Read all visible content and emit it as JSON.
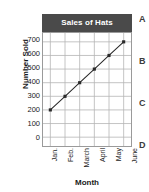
{
  "chart_data": {
    "type": "line",
    "title": "Sales of Hats",
    "xlabel": "Month",
    "ylabel": "Number Sold",
    "categories": [
      "Jan.",
      "Feb.",
      "March",
      "April",
      "May",
      "June"
    ],
    "values": [
      200,
      300,
      400,
      500,
      600,
      700
    ],
    "series": [
      {
        "name": "Number Sold",
        "values": [
          200,
          300,
          400,
          500,
          600,
          700
        ]
      }
    ],
    "ylim": [
      0,
      700
    ],
    "y_ticks": [
      700,
      600,
      500,
      400,
      300,
      200,
      100,
      0
    ],
    "y_tick_labels": [
      "700",
      "600",
      "500",
      "400",
      "300",
      "200",
      "100",
      "0"
    ],
    "grid": true,
    "legend": false,
    "marker": "filled-square",
    "line_color": "#2a2a2a",
    "marker_color": "#2a2a2a",
    "grid_color": "#b4b4b4",
    "axis_color": "#9a9a9a",
    "title_background_color": "#4a4a4a",
    "title_text_color": "#ffffff"
  },
  "answer_choices": [
    {
      "label": "A"
    },
    {
      "label": "B"
    },
    {
      "label": "C"
    },
    {
      "label": "D"
    }
  ]
}
